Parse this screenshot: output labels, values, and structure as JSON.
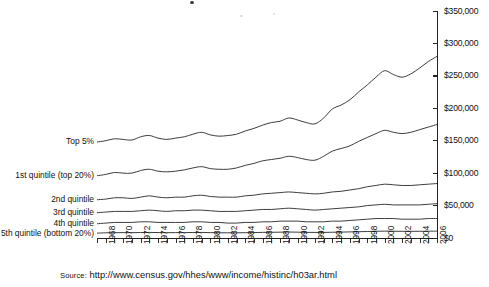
{
  "chart_data": {
    "type": "line",
    "title": "",
    "subtitle": "",
    "xlabel": "",
    "ylabel": "",
    "grid": false,
    "legend_position": "inline-left-labels",
    "y_axis_position": "right",
    "xlim": [
      1967,
      2006
    ],
    "ylim": [
      0,
      350000
    ],
    "y_ticks": [
      0,
      50000,
      100000,
      150000,
      200000,
      250000,
      300000,
      350000
    ],
    "y_tick_labels": [
      "$0",
      "$50,000",
      "$100,000",
      "$150,000",
      "$200,000",
      "$250,000",
      "$300,000",
      "$350,000"
    ],
    "x_tick_labels": [
      "1968",
      "1970",
      "1972",
      "1974",
      "1976",
      "1978",
      "1980",
      "1982",
      "1984",
      "1986",
      "1988",
      "1990",
      "1992",
      "1994",
      "1996",
      "1998",
      "2000",
      "2002",
      "2004",
      "2006"
    ],
    "x_all_years": [
      1967,
      1968,
      1969,
      1970,
      1971,
      1972,
      1973,
      1974,
      1975,
      1976,
      1977,
      1978,
      1979,
      1980,
      1981,
      1982,
      1983,
      1984,
      1985,
      1986,
      1987,
      1988,
      1989,
      1990,
      1991,
      1992,
      1993,
      1994,
      1995,
      1996,
      1997,
      1998,
      1999,
      2000,
      2001,
      2002,
      2003,
      2004,
      2005,
      2006
    ],
    "series": [
      {
        "name": "Top 5%",
        "label": "Top 5%",
        "color": "#333333",
        "values": [
          148000,
          150000,
          153000,
          152000,
          151000,
          156000,
          158000,
          154000,
          152000,
          154000,
          156000,
          160000,
          163000,
          159000,
          157000,
          158000,
          160000,
          165000,
          169000,
          174000,
          178000,
          180000,
          185000,
          182000,
          178000,
          176000,
          185000,
          199000,
          205000,
          213000,
          225000,
          236000,
          248000,
          258000,
          252000,
          248000,
          253000,
          262000,
          272000,
          280000
        ]
      },
      {
        "name": "1st quintile (top 20%)",
        "label": "1st quintile (top 20%)",
        "color": "#333333",
        "values": [
          96000,
          98000,
          101000,
          100000,
          100000,
          104000,
          106000,
          103000,
          102000,
          103000,
          105000,
          108000,
          110000,
          107000,
          106000,
          106000,
          108000,
          112000,
          115000,
          119000,
          121000,
          123000,
          126000,
          124000,
          121000,
          120000,
          126000,
          134000,
          138000,
          142000,
          149000,
          155000,
          161000,
          166000,
          163000,
          161000,
          163000,
          167000,
          171000,
          175000
        ]
      },
      {
        "name": "2nd quintile",
        "label": "2nd quintile",
        "color": "#333333",
        "values": [
          59000,
          60000,
          62000,
          62000,
          61000,
          63000,
          65000,
          63000,
          62000,
          63000,
          63000,
          65000,
          66000,
          64000,
          63000,
          63000,
          63000,
          65000,
          66000,
          68000,
          69000,
          70000,
          71000,
          70000,
          69000,
          68000,
          69000,
          71000,
          72000,
          74000,
          76000,
          79000,
          81000,
          83000,
          82000,
          81000,
          81000,
          82000,
          83000,
          84000
        ]
      },
      {
        "name": "3rd quintile",
        "label": "3rd quintile",
        "color": "#333333",
        "values": [
          39000,
          40000,
          41000,
          41000,
          41000,
          42000,
          43000,
          42000,
          41000,
          42000,
          42000,
          43000,
          43000,
          42000,
          41000,
          41000,
          41000,
          42000,
          43000,
          44000,
          44000,
          45000,
          46000,
          45000,
          44000,
          43000,
          44000,
          45000,
          46000,
          47000,
          48000,
          50000,
          51000,
          52000,
          51000,
          51000,
          51000,
          51000,
          52000,
          53000
        ]
      },
      {
        "name": "4th quintile",
        "label": "4th quintile",
        "color": "#333333",
        "values": [
          22000,
          23000,
          24000,
          24000,
          24000,
          25000,
          25000,
          24000,
          24000,
          24000,
          24000,
          25000,
          25000,
          24000,
          24000,
          23000,
          23000,
          24000,
          24000,
          25000,
          25000,
          26000,
          26000,
          26000,
          25000,
          25000,
          25000,
          26000,
          26000,
          27000,
          28000,
          29000,
          30000,
          30000,
          30000,
          29000,
          29000,
          29000,
          30000,
          30000
        ]
      },
      {
        "name": "5th quintile (bottom 20%)",
        "label": "5th quintile (bottom 20%)",
        "color": "#333333",
        "values": [
          7500,
          8000,
          8200,
          8300,
          8200,
          8400,
          8600,
          8400,
          8200,
          8300,
          8300,
          8500,
          8600,
          8300,
          8100,
          8000,
          8000,
          8200,
          8400,
          8700,
          8800,
          9000,
          9200,
          9000,
          8700,
          8600,
          8600,
          8900,
          9100,
          9400,
          9700,
          10000,
          10400,
          10600,
          10400,
          10300,
          10300,
          10300,
          10500,
          10600
        ]
      }
    ]
  },
  "source": {
    "kicker": "Source:",
    "url": "http://www.census.gov/hhes/www/income/histinc/h03ar.html"
  }
}
